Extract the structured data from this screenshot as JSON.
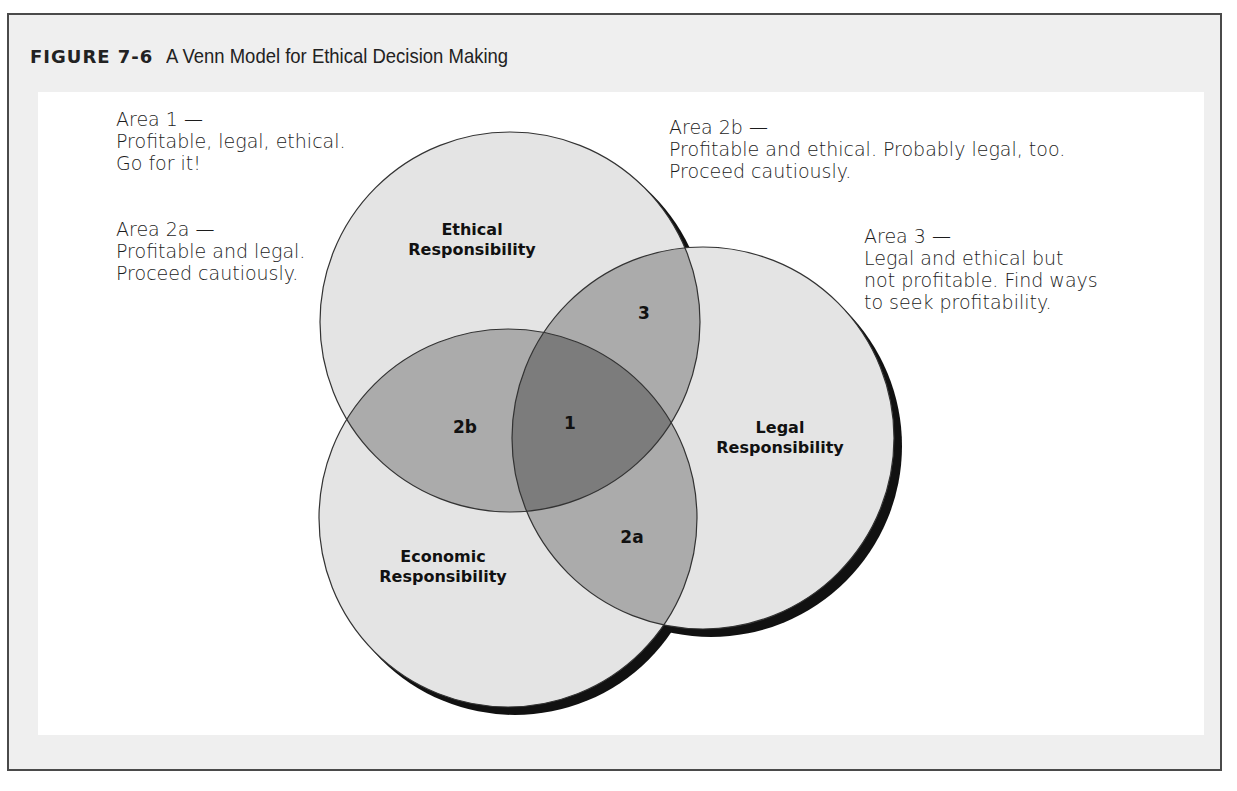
{
  "figure": {
    "number": "FIGURE 7-6",
    "caption": "A Venn Model for Ethical Decision Making"
  },
  "circles": [
    {
      "id": "ethical",
      "label_line1": "Ethical",
      "label_line2": "Responsibility",
      "cx": 510,
      "cy": 322,
      "r": 190
    },
    {
      "id": "legal",
      "label_line1": "Legal",
      "label_line2": "Responsibility",
      "cx": 703,
      "cy": 438,
      "r": 191
    },
    {
      "id": "economic",
      "label_line1": "Economic",
      "label_line2": "Responsibility",
      "cx": 508,
      "cy": 518,
      "r": 189
    }
  ],
  "regions": {
    "r1": "1",
    "r2a": "2a",
    "r2b": "2b",
    "r3": "3"
  },
  "notes": {
    "area1": {
      "title": "Area 1 —",
      "lines": [
        "Profitable, legal, ethical.",
        "Go for it!"
      ]
    },
    "area2a": {
      "title": "Area 2a —",
      "lines": [
        "Profitable and legal.",
        "Proceed cautiously."
      ]
    },
    "area2b": {
      "title": "Area 2b —",
      "lines": [
        "Profitable and ethical. Probably legal, too.",
        "Proceed cautiously."
      ]
    },
    "area3": {
      "title": "Area 3 —",
      "lines": [
        "Legal and ethical but",
        "not profitable. Find ways",
        "to seek profitability."
      ]
    }
  },
  "colors": {
    "single": "#e4e4e4",
    "double": "#ababab",
    "triple": "#7c7c7c",
    "outline": "#333333",
    "shadow": "#111111",
    "frame_band": "#efefef",
    "frame_border": "#4a4a4a"
  }
}
